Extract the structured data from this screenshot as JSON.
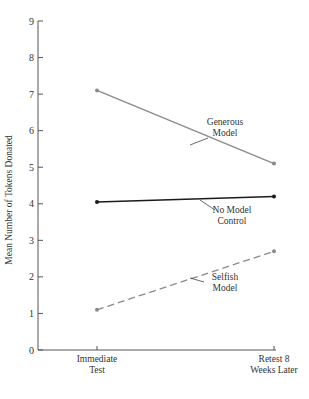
{
  "chart_data": {
    "type": "line",
    "title": "",
    "xlabel": "",
    "ylabel": "Mean Number of Tokens Donated",
    "categories": [
      "Immediate Test",
      "Retest 8 Weeks Later"
    ],
    "category_lines": [
      [
        "Immediate",
        "Test"
      ],
      [
        "Retest 8",
        "Weeks Later"
      ]
    ],
    "ylim": [
      0,
      9
    ],
    "yticks": [
      0,
      1,
      2,
      3,
      4,
      5,
      6,
      7,
      8,
      9
    ],
    "grid": false,
    "legend": "inline-labels",
    "series": [
      {
        "name": "Generous Model",
        "label_lines": [
          "Generous",
          "Model"
        ],
        "values": [
          7.1,
          5.1
        ],
        "color": "#8a8a8a",
        "style": "solid"
      },
      {
        "name": "No Model Control",
        "label_lines": [
          "No Model",
          "Control"
        ],
        "values": [
          4.05,
          4.2
        ],
        "color": "#1a1a1a",
        "style": "solid"
      },
      {
        "name": "Selfish Model",
        "label_lines": [
          "Selfish",
          "Model"
        ],
        "values": [
          1.1,
          2.7
        ],
        "color": "#8a8a8a",
        "style": "dashed"
      }
    ]
  }
}
